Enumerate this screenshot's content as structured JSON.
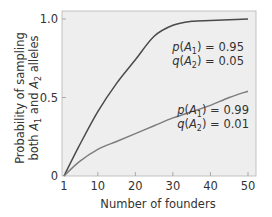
{
  "chart_data": {
    "type": "line",
    "title": "",
    "xlabel": "Number of founders",
    "ylabel_line1": "Probability of sampling",
    "ylabel_line2": "both A1 and A2 alleles",
    "xlim": [
      1,
      52
    ],
    "ylim": [
      0,
      1.05
    ],
    "xticks": [
      1,
      10,
      20,
      30,
      40,
      50
    ],
    "xtick_labels": [
      "1",
      "10",
      "20",
      "30",
      "40",
      "50"
    ],
    "yticks": [
      0,
      0.5,
      1.0
    ],
    "ytick_labels": [
      "0",
      "0.5",
      "1.0"
    ],
    "grid": false,
    "background": "#eeeeee",
    "series": [
      {
        "name": "p(A1) = 0.95, q(A2) = 0.05",
        "color": "#4a4a4a",
        "x": [
          1,
          5,
          10,
          15,
          20,
          25,
          30,
          35,
          40,
          45,
          50
        ],
        "values": [
          0.0,
          0.19,
          0.41,
          0.59,
          0.74,
          0.89,
          0.96,
          0.985,
          0.99,
          0.995,
          1.0
        ]
      },
      {
        "name": "p(A1) = 0.99, q(A2) = 0.01",
        "color": "#7d7d7d",
        "x": [
          1,
          5,
          10,
          15,
          20,
          25,
          30,
          35,
          40,
          45,
          50
        ],
        "values": [
          0.0,
          0.09,
          0.17,
          0.22,
          0.27,
          0.32,
          0.37,
          0.41,
          0.45,
          0.5,
          0.54
        ]
      }
    ],
    "annotations": [
      {
        "line1": {
          "p": "p",
          "A": "A",
          "sub": "1",
          "rest": ") = 0.95"
        },
        "line2": {
          "q": "q",
          "A": "A",
          "sub": "2",
          "rest": ") = 0.05"
        }
      },
      {
        "line1": {
          "p": "p",
          "A": "A",
          "sub": "1",
          "rest": ") = 0.99"
        },
        "line2": {
          "q": "q",
          "A": "A",
          "sub": "2",
          "rest": ") = 0.01"
        }
      }
    ]
  },
  "labels": {
    "xlabel": "Number of founders",
    "ylabel_a": "Probability of sampling",
    "ylabel_b_prefix": "both ",
    "ylabel_b_A": "A",
    "ylabel_b_sub1": "1",
    "ylabel_b_mid": " and ",
    "ylabel_b_sub2": "2",
    "ylabel_b_suffix": " alleles",
    "ann1_l1_val": ") = 0.95",
    "ann1_l2_val": ") = 0.05",
    "ann2_l1_val": ") = 0.99",
    "ann2_l2_val": ") = 0.01",
    "p": "p",
    "q": "q",
    "A": "A",
    "paren": "(",
    "sub1": "1",
    "sub2": "2"
  }
}
